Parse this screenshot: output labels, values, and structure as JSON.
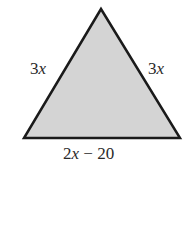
{
  "diagram": {
    "type": "triangle",
    "kind": "isosceles",
    "fill_color": "#d4d4d4",
    "stroke_color": "#1a1a1a",
    "vertices": {
      "apex": [
        101,
        9
      ],
      "bottom_left": [
        24,
        138
      ],
      "bottom_right": [
        180,
        138
      ]
    },
    "labels": {
      "left_side": {
        "coef": "3",
        "var": "x"
      },
      "right_side": {
        "coef": "3",
        "var": "x"
      },
      "base": {
        "coef": "2",
        "var": "x",
        "rest": " − 20"
      }
    }
  }
}
